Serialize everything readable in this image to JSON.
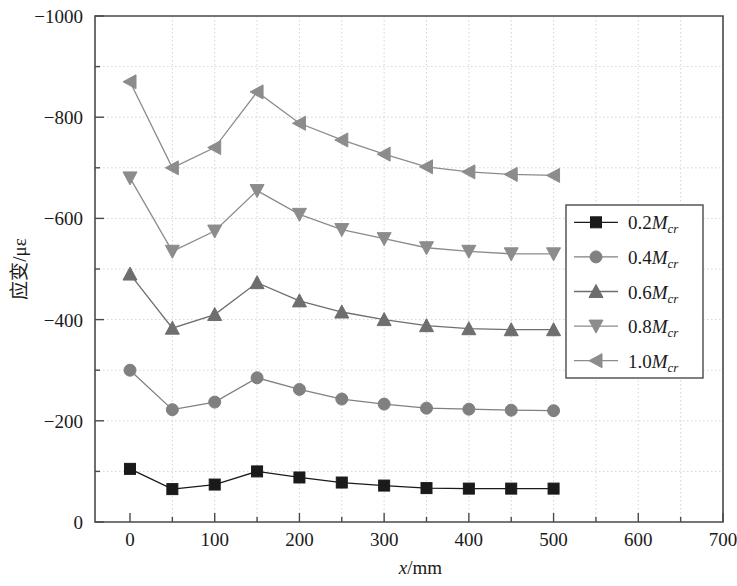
{
  "chart_data": {
    "type": "line",
    "title": "",
    "xlabel": "x/mm",
    "ylabel": "应变/με",
    "xlim": [
      0,
      700
    ],
    "ylim": [
      -1000,
      0
    ],
    "y_axis_inverted": true,
    "grid": true,
    "grid_style": "dotted",
    "legend_position": "right-middle",
    "x": [
      0,
      50,
      100,
      150,
      200,
      250,
      300,
      350,
      400,
      450,
      500
    ],
    "xticks": [
      0,
      100,
      200,
      300,
      400,
      500,
      600,
      700
    ],
    "xtick_labels": [
      "0",
      "100",
      "200",
      "300",
      "400",
      "500",
      "600",
      "700"
    ],
    "x_minor_ticks": [
      50,
      150,
      250,
      350,
      450,
      550,
      650
    ],
    "yticks": [
      -1000,
      -800,
      -600,
      -400,
      -200,
      0
    ],
    "ytick_labels": [
      "−1000",
      "−800",
      "−600",
      "−400",
      "−200",
      "0"
    ],
    "y_minor_ticks": [
      -900,
      -700,
      -500,
      -300,
      -100
    ],
    "series": [
      {
        "name": "0.2Mcr",
        "label_num": "0.2",
        "label_sym": "M",
        "label_sub": "cr",
        "marker": "square",
        "color": "#1a1a1a",
        "values": [
          -105,
          -65,
          -74,
          -100,
          -88,
          -78,
          -72,
          -67,
          -66,
          -66,
          -66
        ]
      },
      {
        "name": "0.4Mcr",
        "label_num": "0.4",
        "label_sym": "M",
        "label_sub": "cr",
        "marker": "circle",
        "color": "#808080",
        "values": [
          -300,
          -222,
          -237,
          -285,
          -262,
          -243,
          -233,
          -225,
          -223,
          -221,
          -220
        ]
      },
      {
        "name": "0.6Mcr",
        "label_num": "0.6",
        "label_sym": "M",
        "label_sub": "cr",
        "marker": "triangle-up",
        "color": "#6e6e6e",
        "values": [
          -490,
          -383,
          -410,
          -473,
          -437,
          -415,
          -400,
          -388,
          -382,
          -380,
          -380
        ]
      },
      {
        "name": "0.8Mcr",
        "label_num": "0.8",
        "label_sym": "M",
        "label_sub": "cr",
        "marker": "triangle-down",
        "color": "#8c8c8c",
        "values": [
          -680,
          -535,
          -575,
          -655,
          -608,
          -578,
          -560,
          -542,
          -535,
          -530,
          -530
        ]
      },
      {
        "name": "1.0Mcr",
        "label_num": "1.0",
        "label_sym": "M",
        "label_sub": "cr",
        "marker": "triangle-left",
        "color": "#8c8c8c",
        "values": [
          -870,
          -700,
          -740,
          -850,
          -788,
          -755,
          -727,
          -702,
          -692,
          -687,
          -685
        ]
      }
    ]
  },
  "axes": {
    "x_title_italic": "x",
    "x_title_rest": "/mm",
    "y_title_cjk": "应变",
    "y_title_rest": "/με"
  }
}
